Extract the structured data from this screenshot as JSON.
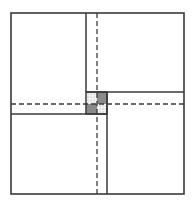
{
  "diagram": {
    "colors": {
      "background": "#ffffff",
      "line": "#3a3a3a",
      "dark_fill": "#8a8a8a",
      "dotted_fill": "#e6e6e6"
    },
    "outer_frame": {
      "x1": 11,
      "y1": 13,
      "x2": 184,
      "y2": 194
    },
    "solid_lines": [
      {
        "name": "top-vertical",
        "x1": 86,
        "y1": 13,
        "x2": 86,
        "y2": 92
      },
      {
        "name": "right-horizontal",
        "x1": 86,
        "y1": 92,
        "x2": 184,
        "y2": 92
      },
      {
        "name": "bottom-vertical",
        "x1": 107,
        "y1": 92,
        "x2": 107,
        "y2": 194
      },
      {
        "name": "left-horizontal",
        "x1": 11,
        "y1": 114,
        "x2": 107,
        "y2": 114
      }
    ],
    "dashed_lines": [
      {
        "name": "center-vertical",
        "x1": 97,
        "y1": 13,
        "x2": 97,
        "y2": 194
      },
      {
        "name": "center-horizontal",
        "x1": 11,
        "y1": 104,
        "x2": 184,
        "y2": 104
      }
    ],
    "center_cells": [
      {
        "name": "top-left-cell",
        "x": 86,
        "y": 92,
        "w": 11,
        "h": 12,
        "fill": "dotted"
      },
      {
        "name": "top-right-cell",
        "x": 97,
        "y": 92,
        "w": 10,
        "h": 12,
        "fill": "dark"
      },
      {
        "name": "bottom-left-cell",
        "x": 86,
        "y": 104,
        "w": 11,
        "h": 10,
        "fill": "dark"
      },
      {
        "name": "bottom-right-cell",
        "x": 97,
        "y": 104,
        "w": 10,
        "h": 10,
        "fill": "dotted"
      }
    ]
  }
}
